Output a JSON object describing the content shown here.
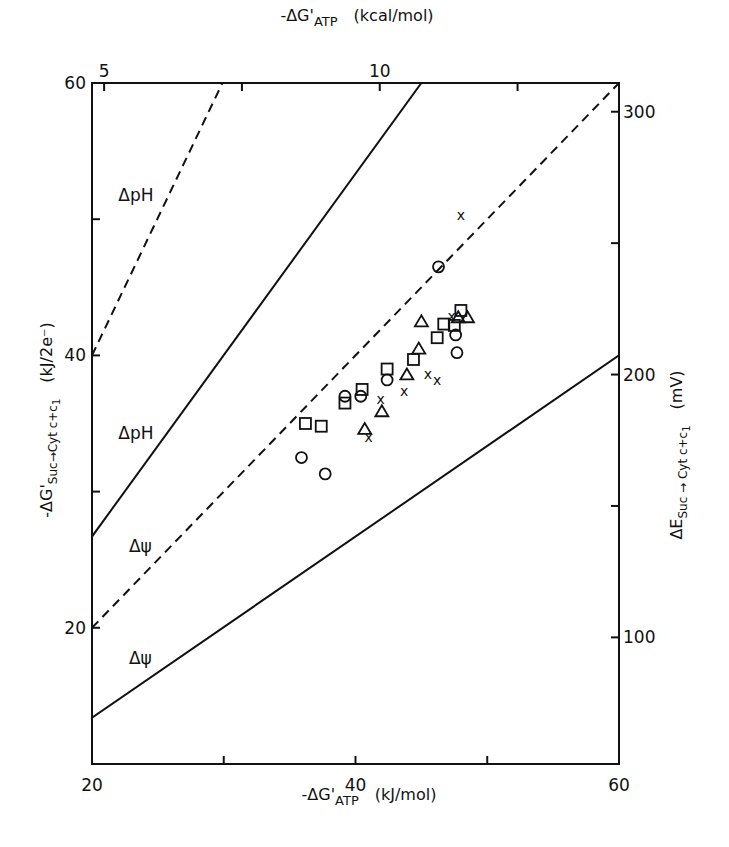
{
  "chart_data": {
    "type": "scatter",
    "title": "",
    "xlabel": "-ΔG'ATP (kJ/mol)",
    "xlabel_main": "-ΔG'",
    "xlabel_sub": "ATP",
    "xlabel_unit": "(kJ/mol)",
    "x2label_main": "-ΔG'",
    "x2label_sub": "ATP",
    "x2label_unit": "(kcal/mol)",
    "ylabel": "-ΔG'Suc→Cyt c+c1 (kJ/2e⁻)",
    "ylabel_main": "-ΔG'",
    "ylabel_sub": "Suc→Cyt c+c",
    "ylabel_subsub": "1",
    "ylabel_unit": "(kJ/2e⁻)",
    "y2label_main": "ΔE",
    "y2label_sub": "Suc → Cyt c+c",
    "y2label_subsub": "1",
    "y2label_unit": "(mV)",
    "xlim": [
      20,
      60
    ],
    "ylim": [
      10,
      60
    ],
    "x_ticks": [
      20,
      30,
      40,
      50,
      60
    ],
    "x_tick_labels": [
      "20",
      "",
      "40",
      "",
      "60"
    ],
    "y_ticks": [
      20,
      30,
      40,
      50,
      60
    ],
    "y_tick_labels": [
      "20",
      "",
      "40",
      "",
      "60"
    ],
    "x2_ticks_kcal": [
      5,
      7.5,
      10,
      12.5
    ],
    "x2_tick_labels": [
      "5",
      "",
      "10",
      ""
    ],
    "y2_ticks_mV": [
      100,
      150,
      200,
      250,
      300
    ],
    "y2_tick_labels": [
      "100",
      "",
      "200",
      "",
      "300"
    ],
    "grid": false,
    "lines": [
      {
        "name": "ΔpH",
        "style": "dashed",
        "x": [
          20,
          29.9
        ],
        "y": [
          40,
          60
        ],
        "label_pos": [
          22,
          51.8
        ]
      },
      {
        "name": "ΔpH",
        "style": "solid",
        "x": [
          20,
          45
        ],
        "y": [
          26.7,
          60
        ],
        "label_pos": [
          22,
          34.3
        ]
      },
      {
        "name": "Δψ",
        "style": "dashed",
        "x": [
          20,
          60
        ],
        "y": [
          20,
          60
        ],
        "label_pos": [
          22.8,
          26
        ]
      },
      {
        "name": "Δψ",
        "style": "solid",
        "x": [
          20,
          60
        ],
        "y": [
          13.4,
          40
        ],
        "label_pos": [
          22.8,
          17.8
        ]
      }
    ],
    "series": [
      {
        "name": "circle",
        "marker": "o",
        "x": [
          35.9,
          37.7,
          39.2,
          40.4,
          42.4,
          46.3,
          47.6,
          47.7
        ],
        "y": [
          32.5,
          31.3,
          37.0,
          37.0,
          38.2,
          46.5,
          41.5,
          40.2
        ]
      },
      {
        "name": "square",
        "marker": "s",
        "x": [
          36.2,
          37.4,
          39.2,
          40.5,
          42.4,
          44.4,
          46.2,
          46.7,
          47.5,
          48.0
        ],
        "y": [
          35.0,
          34.8,
          36.5,
          37.5,
          39.0,
          39.7,
          41.3,
          42.3,
          42.2,
          43.3
        ]
      },
      {
        "name": "triangle",
        "marker": "^",
        "x": [
          40.7,
          42.0,
          43.9,
          44.8,
          45.0,
          47.8,
          48.5
        ],
        "y": [
          34.6,
          35.9,
          38.6,
          40.5,
          42.5,
          42.8,
          42.8
        ]
      },
      {
        "name": "cross",
        "marker": "x",
        "x": [
          41.0,
          41.9,
          43.7,
          45.5,
          46.2,
          47.3,
          48.0
        ],
        "y": [
          34.0,
          36.8,
          37.4,
          38.6,
          38.2,
          42.9,
          50.3
        ]
      }
    ]
  }
}
